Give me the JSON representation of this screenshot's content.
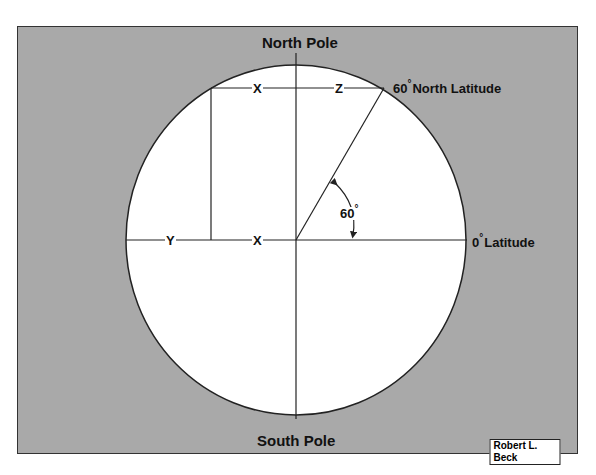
{
  "diagram": {
    "labels": {
      "north_pole": "North Pole",
      "south_pole": "South Pole",
      "north_latitude_deg": "60",
      "north_latitude_text": "North Latitude",
      "equator_deg": "0",
      "equator_text": "Latitude",
      "angle_value": "60",
      "degree_symbol": "°",
      "x_top": "X",
      "z_top": "Z",
      "y_equator": "Y",
      "x_equator": "X"
    },
    "credit": "Robert L. Beck",
    "colors": {
      "background_frame": "#a9a9a9",
      "earth_fill": "#ffffff",
      "lines": "#222222"
    },
    "geometry": {
      "center": [
        296,
        240
      ],
      "radius_x": 170,
      "radius_y": 175,
      "latitude_angle_deg": 60
    }
  }
}
